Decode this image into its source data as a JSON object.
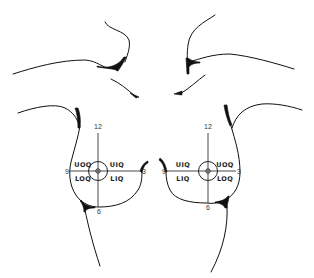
{
  "diagram": {
    "left_breast": {
      "clock": {
        "top": "12",
        "left": "9",
        "right": "3",
        "bottom": "6"
      },
      "quadrants": {
        "upper_left": "UOQ",
        "upper_right": "UIQ",
        "lower_left": "LOQ",
        "lower_right": "LIQ"
      }
    },
    "right_breast": {
      "clock": {
        "top": "12",
        "left": "9",
        "right": "3",
        "bottom": "6"
      },
      "quadrants": {
        "upper_left": "UIQ",
        "upper_right": "UOQ",
        "lower_left": "LIQ",
        "lower_right": "LOQ"
      }
    },
    "colors": {
      "line": "#111111",
      "background": "#ffffff"
    }
  }
}
